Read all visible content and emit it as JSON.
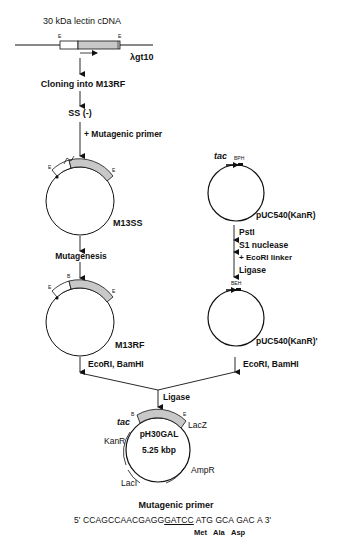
{
  "diagram": {
    "title": "30 kDa lectin cDNA",
    "vector_lambda": "λgt10",
    "left_pathway": {
      "steps": [
        "Cloning into M13RF",
        "SS (-)",
        "+ Mutagenic primer",
        "Mutagenesis",
        "EcoRI, BamHI"
      ],
      "plasmids": [
        "M13SS",
        "M13RF"
      ]
    },
    "right_pathway": {
      "promoter": "tac",
      "sites_top": "BPH",
      "sites_bottom": "BEH",
      "plasmids": [
        "pUC540(KanR)",
        "pUC540(KanR)'"
      ],
      "steps": [
        "PstI",
        "S1 nuclease",
        "+ EcoRI linker",
        "Ligase",
        "EcoRI, BamHI"
      ]
    },
    "merge_step": "Ligase",
    "final_plasmid": {
      "name": "pH30GAL",
      "size": "5.25 kbp",
      "promoter": "tac",
      "genes": [
        "LacZ",
        "KanR",
        "AmpR",
        "LacI"
      ]
    },
    "site_labels": {
      "E": "E",
      "B": "B"
    },
    "primer": {
      "heading": "Mutagenic primer",
      "five_prime": "5'",
      "seq_before": "CCAGCCAACGAGG",
      "seq_underlined": "GATCC",
      "codons": [
        "ATG",
        "GCA",
        "GAC",
        "A"
      ],
      "three_prime": "3'",
      "amino_acids": [
        "Met",
        "Ala",
        "Asp"
      ]
    }
  }
}
